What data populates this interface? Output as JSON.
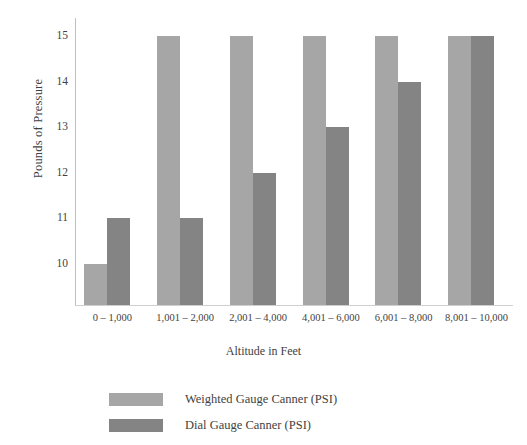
{
  "chart_data": {
    "type": "bar",
    "title": "",
    "xlabel": "Altitude in Feet",
    "ylabel": "Pounds of Pressure",
    "categories": [
      "0 – 1,000",
      "1,001 – 2,000",
      "2,001 – 4,000",
      "4,001 – 6,000",
      "6,001 – 8,000",
      "8,001 – 10,000"
    ],
    "series": [
      {
        "name": "Weighted Gauge Canner (PSI)",
        "color": "#a6a6a6",
        "values": [
          10,
          15,
          15,
          15,
          15,
          15
        ]
      },
      {
        "name": "Dial Gauge Canner (PSI)",
        "color": "#848484",
        "values": [
          11,
          11,
          12,
          13,
          14,
          15
        ]
      }
    ],
    "ylim": [
      9.1,
      15.4
    ],
    "yticks": [
      10,
      11,
      12,
      13,
      14,
      15
    ],
    "ytick_labels": [
      "10",
      "11",
      "12",
      "13",
      "14",
      "15"
    ],
    "grid": false,
    "legend_position": "bottom-center"
  },
  "axes": {
    "y_title": "Pounds of Pressure",
    "x_title": "Altitude in Feet"
  },
  "legend": {
    "items": [
      {
        "label": "Weighted Gauge Canner (PSI)",
        "color": "#a6a6a6"
      },
      {
        "label": "Dial Gauge Canner (PSI)",
        "color": "#848484"
      }
    ]
  }
}
